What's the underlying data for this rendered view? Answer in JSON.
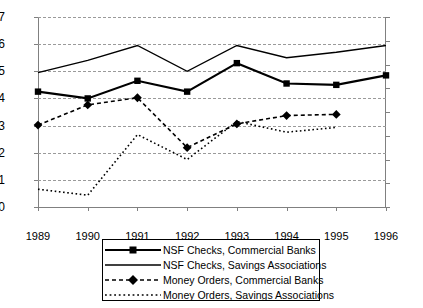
{
  "chart_data": {
    "type": "line",
    "title": "",
    "xlabel": "",
    "ylabel": "",
    "categories": [
      "1989",
      "1990",
      "1991",
      "1992",
      "1993",
      "1994",
      "1995",
      "1996"
    ],
    "left_axis": {
      "ticks": [
        "10",
        "11",
        "12",
        "13",
        "14",
        "15",
        "16",
        "17"
      ],
      "values": [
        10,
        11,
        12,
        13,
        14,
        15,
        16,
        17
      ],
      "ylim": [
        10,
        17
      ]
    },
    "right_axis": {
      "ticks": [
        "1.5",
        "1.7",
        "1.9",
        "2.1",
        "2.3",
        "2.5",
        "2.7",
        "2.9",
        "3.1"
      ],
      "values": [
        1.5,
        1.7,
        1.9,
        2.1,
        2.3,
        2.5,
        2.7,
        2.9,
        3.1
      ],
      "ylim": [
        1.5,
        3.1
      ]
    },
    "grid": true,
    "legend_position": "bottom",
    "series": [
      {
        "name": "NSF Checks, Commercial Banks",
        "axis": "left",
        "style": "solid-thick",
        "marker": "square",
        "x": [
          "1989",
          "1990",
          "1991",
          "1992",
          "1993",
          "1994",
          "1995",
          "1996"
        ],
        "values": [
          14.25,
          14.0,
          14.65,
          14.25,
          15.3,
          14.55,
          14.5,
          14.85
        ]
      },
      {
        "name": "NSF Checks, Savings Associations",
        "axis": "left",
        "style": "solid-thin",
        "marker": "none",
        "x": [
          "1989",
          "1990",
          "1991",
          "1992",
          "1993",
          "1994",
          "1995",
          "1996"
        ],
        "values": [
          14.95,
          15.4,
          15.95,
          15.0,
          15.95,
          15.5,
          15.7,
          15.95
        ]
      },
      {
        "name": "Money Orders, Commercial Banks",
        "axis": "right",
        "style": "dashed",
        "marker": "diamond",
        "x": [
          "1989",
          "1990",
          "1991",
          "1992",
          "1993",
          "1994",
          "1995"
        ],
        "values": [
          2.19,
          2.36,
          2.42,
          2.0,
          2.2,
          2.27,
          2.28
        ]
      },
      {
        "name": "Money Orders, Savings Associations",
        "axis": "right",
        "style": "dotted",
        "marker": "none",
        "x": [
          "1989",
          "1990",
          "1991",
          "1992",
          "1993",
          "1994",
          "1995"
        ],
        "values": [
          1.65,
          1.6,
          2.11,
          1.9,
          2.22,
          2.13,
          2.17
        ]
      }
    ]
  },
  "legend": {
    "items": [
      {
        "label": "NSF Checks, Commercial Banks",
        "key": "solid-thick-square"
      },
      {
        "label": "NSF Checks, Savings Associations",
        "key": "solid-thin"
      },
      {
        "label": "Money Orders, Commercial Banks",
        "key": "dashed-diamond"
      },
      {
        "label": "Money Orders, Savings Associations",
        "key": "dotted"
      }
    ]
  },
  "colors": {
    "series": "#000000",
    "grid": "#9a9a9a",
    "axis": "#808080",
    "background": "#ffffff"
  }
}
